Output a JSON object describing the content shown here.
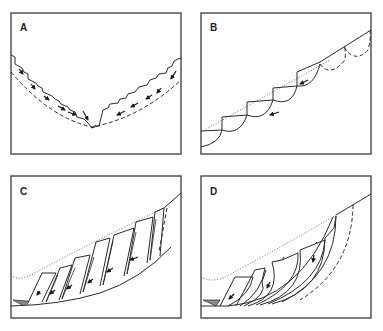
{
  "figure": {
    "type": "four-panel schematic diagram of slope failure mechanisms",
    "panels": [
      {
        "id": "A",
        "label": "A",
        "description": "V-shaped valley with stepped slump blocks on both flanks, dashed basal surface, arrows pointing downslope toward valley floor"
      },
      {
        "id": "B",
        "label": "B",
        "description": "Inclined slope with successive rotational (curved) slump scars in a staircase, dotted original surface, dashed incipient failures at top, arrows on blocks"
      },
      {
        "id": "C",
        "label": "C",
        "description": "Concave slope with tilted slab blocks resting on planar/curved base, dotted original surface, dashed incipient crack at upslope end, debris wedge at toe"
      },
      {
        "id": "D",
        "label": "D",
        "description": "Concave slope with curved rotational slices on a curved base, dotted original surface, dashed incipient failure surface, debris wedge at toe"
      }
    ]
  },
  "colors": {
    "line": "#2a2a2a",
    "frame": "#3a3a3a",
    "background": "#ffffff"
  }
}
